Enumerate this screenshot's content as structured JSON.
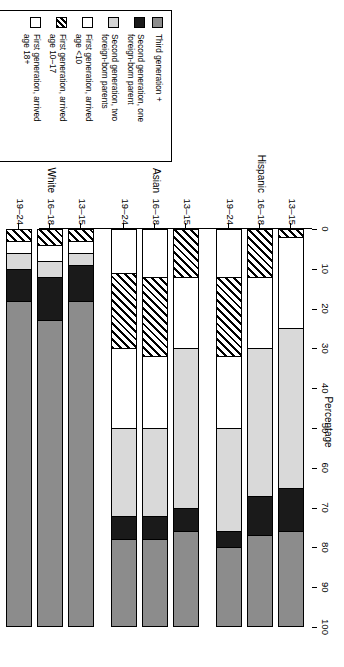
{
  "legend": {
    "items": [
      {
        "label": "Third generation +",
        "swatch": "gray"
      },
      {
        "label": "Second generation, one\nforeign-born parent",
        "swatch": "black"
      },
      {
        "label": "Second generation, two\nforeign-born parents",
        "swatch": "light-gray"
      },
      {
        "label": "First generation, arrived\nage <10",
        "swatch": "white"
      },
      {
        "label": "First generation, arrived\nage 10–17",
        "swatch": "hatch"
      },
      {
        "label": "First generation, arrived\nage 18+",
        "swatch": "white"
      }
    ]
  },
  "axis": {
    "title": "Percentage",
    "ticks": [
      "0",
      "10",
      "20",
      "30",
      "40",
      "50",
      "60",
      "70",
      "80",
      "90",
      "100"
    ]
  },
  "groups": [
    {
      "name": "Hispanic",
      "ages": [
        "13–15",
        "16–18",
        "19–24"
      ]
    },
    {
      "name": "Asian",
      "ages": [
        "13–15",
        "16–18",
        "19–24"
      ]
    },
    {
      "name": "White",
      "ages": [
        "13–15",
        "16–18",
        "19–24"
      ]
    }
  ],
  "colors": {
    "third_generation": "#8c8c8c",
    "second_generation_one": "#1a1a1a",
    "second_generation_two": "#d9d9d9",
    "first_generation_under10": "#ffffff",
    "first_generation_10_17": "#ffffff",
    "first_generation_18plus": "#ffffff",
    "outline": "#000000"
  },
  "chart_data": {
    "type": "bar",
    "title": "",
    "subtitle": "",
    "orientation": "stacked-100-percent",
    "xlabel": "",
    "ylabel": "Percentage",
    "ylim": [
      0,
      100
    ],
    "grid": false,
    "legend_position": "top",
    "categories": [
      "Hispanic 13–15",
      "Hispanic 16–18",
      "Hispanic 19–24",
      "Asian 13–15",
      "Asian 16–18",
      "Asian 19–24",
      "White 13–15",
      "White 16–18",
      "White 19–24"
    ],
    "series": [
      {
        "name": "First generation, arrived age 18+",
        "values": [
          0,
          0,
          12,
          0,
          12,
          11,
          0,
          0,
          0
        ]
      },
      {
        "name": "First generation, arrived age 10–17",
        "values": [
          2,
          12,
          20,
          12,
          20,
          19,
          3,
          4,
          3
        ]
      },
      {
        "name": "First generation, arrived age <10",
        "values": [
          23,
          18,
          18,
          18,
          18,
          20,
          3,
          4,
          3
        ]
      },
      {
        "name": "Second generation, two foreign-born parents",
        "values": [
          40,
          37,
          26,
          40,
          22,
          22,
          3,
          4,
          4
        ]
      },
      {
        "name": "Second generation, one foreign-born parent",
        "values": [
          11,
          10,
          4,
          6,
          6,
          6,
          9,
          11,
          8
        ]
      },
      {
        "name": "Third generation +",
        "values": [
          24,
          23,
          20,
          24,
          22,
          22,
          82,
          77,
          82
        ]
      }
    ]
  }
}
